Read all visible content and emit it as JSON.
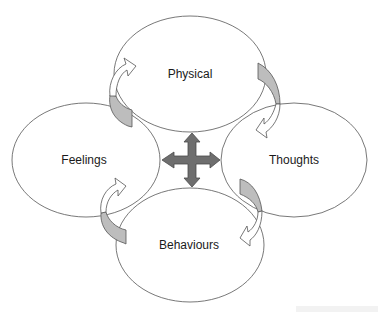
{
  "diagram": {
    "type": "cycle",
    "nodes": [
      {
        "id": "physical",
        "label": "Physical",
        "position": "top"
      },
      {
        "id": "thoughts",
        "label": "Thoughts",
        "position": "right"
      },
      {
        "id": "behaviours",
        "label": "Behaviours",
        "position": "bottom"
      },
      {
        "id": "feelings",
        "label": "Feelings",
        "position": "left"
      }
    ],
    "connections": [
      {
        "from": "physical",
        "to": "thoughts",
        "style": "curved-arrow"
      },
      {
        "from": "thoughts",
        "to": "behaviours",
        "style": "curved-arrow"
      },
      {
        "from": "behaviours",
        "to": "feelings",
        "style": "curved-arrow"
      },
      {
        "from": "feelings",
        "to": "physical",
        "style": "curved-arrow"
      }
    ],
    "center": {
      "symbol": "four-way-arrow",
      "meaning": "all elements interact"
    },
    "colors": {
      "ellipse_stroke": "#555555",
      "shaded_arrow": "#bdbdbd",
      "center_arrow": "#6e6e6e",
      "background": "#ffffff"
    }
  }
}
